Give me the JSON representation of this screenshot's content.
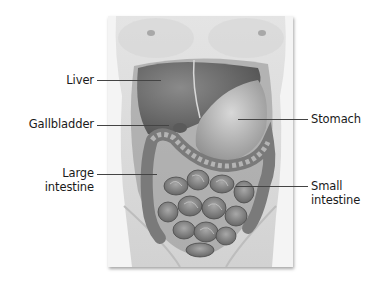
{
  "diagram": {
    "labels": {
      "liver": "Liver",
      "gallbladder": "Gallbladder",
      "large_intestine_line1": "Large",
      "large_intestine_line2": "intestine",
      "stomach": "Stomach",
      "small_intestine_line1": "Small",
      "small_intestine_line2": "intestine"
    },
    "colors": {
      "skin": "#dcdcdc",
      "organ_dark": "#6e6e6e",
      "organ_mid": "#9a9a9a",
      "organ_light": "#c4c4c4",
      "leader_line": "#444444",
      "text": "#1a1a1a"
    }
  }
}
